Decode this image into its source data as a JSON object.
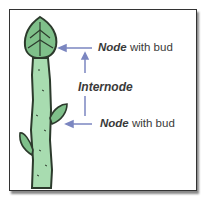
{
  "diagram": {
    "labels": {
      "top": {
        "bold": "Node",
        "rest": " with bud"
      },
      "middle": "Internode",
      "bottom": {
        "bold": "Node",
        "rest": " with bud"
      }
    },
    "colors": {
      "stem": "#a8dcb0",
      "bud": "#7fc08a",
      "outline": "#2c3a2c",
      "arrow": "#7b86c0",
      "frame": "#333333"
    }
  }
}
